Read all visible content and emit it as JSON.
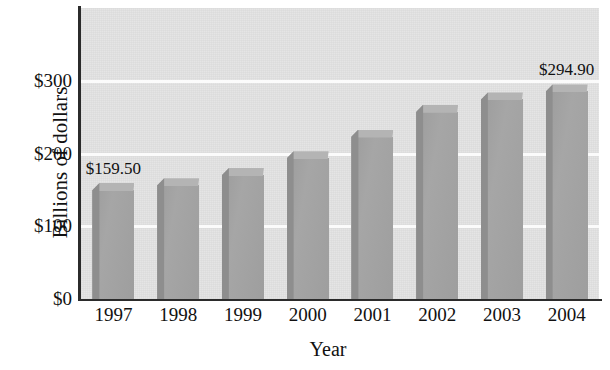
{
  "chart_data": {
    "type": "bar",
    "title": "",
    "xlabel": "Year",
    "ylabel": "Billions of dollars",
    "categories": [
      "1997",
      "1998",
      "1999",
      "2000",
      "2001",
      "2002",
      "2003",
      "2004"
    ],
    "values": [
      159.5,
      166.0,
      180.0,
      203.0,
      233.0,
      267.0,
      284.0,
      294.9
    ],
    "value_labels": [
      {
        "category": "1997",
        "text": "$159.50"
      },
      {
        "category": "2004",
        "text": "$294.90"
      }
    ],
    "ytick_labels": [
      "$0",
      "$100",
      "$200",
      "$300"
    ],
    "ytick_values": [
      0,
      100,
      200,
      300
    ],
    "ylim": [
      0,
      400
    ],
    "xlim": null,
    "grid": true,
    "gridline_color": "#fbfbfb",
    "legend": null,
    "bar_color": "#a3a3a3",
    "bar_top_color": "#b4b4b4",
    "bar_side_color": "#8e8e8e",
    "plot_background": "#e3e3e3",
    "axis_color": "#2b2b2b",
    "text_color": "#111111"
  },
  "axes": {
    "y_title": "Billions of dollars",
    "x_title": "Year"
  }
}
